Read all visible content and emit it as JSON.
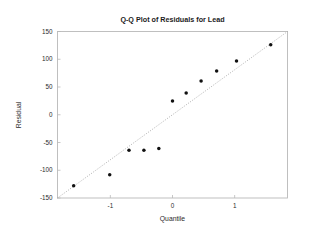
{
  "chart_data": {
    "type": "scatter",
    "title": "Q-Q Plot of Residuals for Lead",
    "xlabel": "Quantile",
    "ylabel": "Residual",
    "xlim": [
      -1.85,
      1.85
    ],
    "ylim": [
      -150,
      150
    ],
    "grid": false,
    "legend": null,
    "xticks": [
      -1,
      0,
      1
    ],
    "xtick_labels": [
      "-1",
      "0",
      "1"
    ],
    "yticks": [
      150,
      100,
      50,
      0,
      -50,
      -100,
      -150
    ],
    "ytick_labels": [
      "150",
      "100",
      "50",
      "0",
      "-50",
      "-100",
      "-150"
    ],
    "series": [
      {
        "name": "residuals",
        "marker": "filled-circle",
        "color": "#111111",
        "x": [
          -1.59,
          -1.01,
          -0.7,
          -0.46,
          -0.22,
          0.0,
          0.22,
          0.46,
          0.71,
          1.03,
          1.58
        ],
        "y": [
          -128,
          -108,
          -64,
          -64,
          -61,
          25,
          39,
          61,
          79,
          97,
          126
        ]
      }
    ],
    "reference_line": {
      "name": "normal-reference-line",
      "style": "dotted",
      "color": "#9a9a9a",
      "x": [
        -1.85,
        1.85
      ],
      "y": [
        -150,
        150
      ]
    }
  },
  "title": "Q-Q Plot of Residuals for Lead",
  "axes": {
    "x_label": "Quantile",
    "y_label": "Residual",
    "x_ticks": [
      "-1",
      "0",
      "1"
    ],
    "y_ticks": [
      "150",
      "100",
      "50",
      "0",
      "-50",
      "-100",
      "-150"
    ]
  },
  "colors": {
    "marker": "#111111",
    "line": "#9a9a9a",
    "frame": "#b9b9b9",
    "text": "#2b2b2b",
    "background": "#ffffff"
  }
}
